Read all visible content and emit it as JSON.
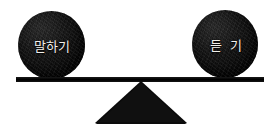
{
  "diagram": {
    "type": "balance-scale",
    "title": "",
    "background_color": "#ffffff",
    "ink_color": "#000000",
    "label_color": "#f2f0ec",
    "left_weight": {
      "label": "말하기",
      "icon": "filled-circle-weight",
      "position": "left",
      "center_x": 51,
      "center_y": 45,
      "diameter": 67
    },
    "right_weight": {
      "label": "듣 기",
      "icon": "filled-circle-weight",
      "position": "right",
      "center_x": 225,
      "center_y": 44,
      "diameter": 66
    },
    "beam": {
      "icon": "horizontal-beam",
      "tilt_degrees": 0,
      "left_x": 16,
      "right_x": 264,
      "y": 79,
      "thickness": 5
    },
    "fulcrum": {
      "icon": "triangle-fulcrum",
      "apex_x": 141,
      "apex_y": 81,
      "base_left_x": 95,
      "base_right_x": 187,
      "base_y": 124
    },
    "state": "balanced"
  }
}
